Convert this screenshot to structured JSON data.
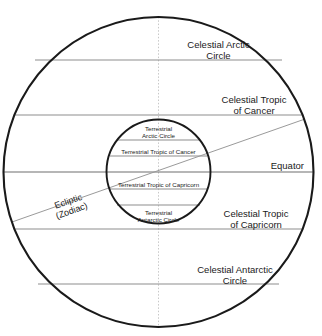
{
  "diagram": {
    "colors": {
      "outer_circle_stroke": "#1a1a1a",
      "inner_circle_stroke": "#1a1a1a",
      "parallel_line": "#8d8d8d",
      "equator_line": "#6f6f6f",
      "ecliptic_line": "#9a9a9a",
      "axis_line": "#c8c8c8",
      "background": "#ffffff",
      "text": "#1a1a1a"
    },
    "geometry": {
      "outer_circle": {
        "cx": 158.5,
        "cy": 172,
        "r": 155,
        "stroke_width": 2.1
      },
      "inner_circle": {
        "cx": 158.5,
        "cy": 171.5,
        "r": 52,
        "stroke_width": 1.9
      },
      "vertical_axis": {
        "x": 158.5,
        "y1": 17,
        "y2": 327
      },
      "celestial_lines_y": {
        "arctic_circle": 60,
        "tropic_of_cancer": 115,
        "equator": 172,
        "tropic_of_capricorn": 229,
        "antarctic_circle": 284
      },
      "terrestrial_lines_y": {
        "arctic_circle": 140,
        "tropic_of_cancer": 156,
        "tropic_of_capricorn": 189,
        "antarctic_circle": 205
      },
      "ecliptic": {
        "x1": 12,
        "y1": 222,
        "x2": 305,
        "y2": 119,
        "angle_deg": -19.4
      }
    },
    "labels": {
      "celestial_arctic": {
        "line1": "Celestial Arctic",
        "line2": "Circle"
      },
      "celestial_tropic_cancer": {
        "line1": "Celestial Tropic",
        "line2": "of Cancer"
      },
      "equator": "Equator",
      "celestial_tropic_capricorn": {
        "line1": "Celestial Tropic",
        "line2": "of Capricorn"
      },
      "celestial_antarctic": {
        "line1": "Celestial Antarctic",
        "line2": "Circle"
      },
      "terrestrial_arctic": {
        "line1": "Terrestrial",
        "line2": "Arctic Circle"
      },
      "terrestrial_tropic_cancer": "Terrestrial Tropic of Cancer",
      "terrestrial_tropic_capricorn": "Terrestrial Tropic of Capricorn",
      "terrestrial_antarctic": {
        "line1": "Terrestrial",
        "line2": "Antarctic Circle"
      },
      "ecliptic": {
        "line1": "Ecliptic",
        "line2": "(Zodiac)"
      }
    }
  }
}
